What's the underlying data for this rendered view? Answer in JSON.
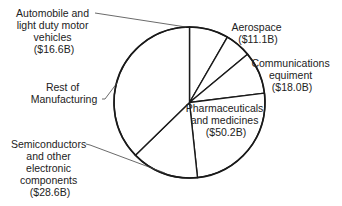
{
  "chart_data": {
    "type": "pie",
    "title": "",
    "unit": "billions USD",
    "start_angle_deg": 0,
    "direction": "clockwise",
    "colors": {
      "fill": "#ffffff",
      "stroke": "#1a1a1a",
      "text": "#222222",
      "leader": "#444444"
    },
    "slices": [
      {
        "name": "Automobile and light duty motor vehicles",
        "value": 16.6,
        "value_label": "($16.6B)",
        "label_lines": [
          "Automobile and",
          "light duty motor",
          "vehicles",
          "($16.6B)"
        ]
      },
      {
        "name": "Aerospace",
        "value": 11.1,
        "value_label": "($11.1B)",
        "label_lines": [
          "Aerospace",
          "($11.1B)"
        ]
      },
      {
        "name": "Communications equiment",
        "value": 18.0,
        "value_label": "($18.0B)",
        "label_lines": [
          "Communications",
          "equiment",
          "($18.0B)"
        ]
      },
      {
        "name": "Pharmaceuticals and medicines",
        "value": 50.2,
        "value_label": "($50.2B)",
        "label_lines": [
          "Pharmaceuticals",
          "and medicines",
          "($50.2B)"
        ]
      },
      {
        "name": "Semiconductors and other electronic components",
        "value": 28.6,
        "value_label": "($28.6B)",
        "label_lines": [
          "Semiconductors",
          "and other",
          "electronic",
          "components",
          "($28.6B)"
        ]
      },
      {
        "name": "Rest of Manufacturing",
        "value": 74.0,
        "value_label": "",
        "value_estimated": true,
        "label_lines": [
          "Rest of",
          "Manufacturing"
        ]
      }
    ]
  }
}
